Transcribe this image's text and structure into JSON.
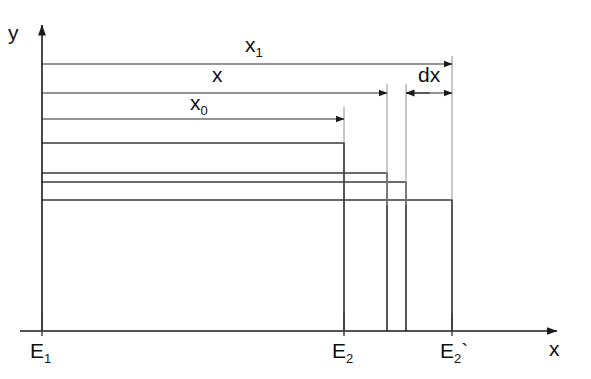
{
  "figure": {
    "background_color": "#ffffff",
    "line_color": "#1a1a1a",
    "rect_color": "#3a3a3a",
    "extension_color": "#9a9a9a",
    "width": 591,
    "height": 379
  },
  "axes": {
    "x_label": "x",
    "y_label": "y",
    "origin_x": 42,
    "origin_y": 331,
    "x_axis_end": 557,
    "y_axis_top": 25
  },
  "axis_ticks": [
    {
      "name": "E1",
      "base": "E",
      "subscript": "1",
      "prime": "",
      "x": 42
    },
    {
      "name": "E2",
      "base": "E",
      "subscript": "2",
      "prime": "",
      "x": 344
    },
    {
      "name": "E2-prime",
      "base": "E",
      "subscript": "2",
      "prime": "`",
      "x": 452
    }
  ],
  "dimensions": [
    {
      "name": "x1",
      "base": "x",
      "subscript": "1",
      "label_x": 245,
      "label_y": 52,
      "y": 64,
      "from_x": 42,
      "to_x": 452,
      "arrow_start": false,
      "arrow_end": true
    },
    {
      "name": "x",
      "base": "x",
      "subscript": "",
      "label_x": 212,
      "label_y": 82,
      "y": 93,
      "from_x": 42,
      "to_x": 387,
      "arrow_start": false,
      "arrow_end": true
    },
    {
      "name": "x0",
      "base": "x",
      "subscript": "0",
      "label_x": 190,
      "label_y": 110,
      "y": 119,
      "from_x": 42,
      "to_x": 344,
      "arrow_start": false,
      "arrow_end": true
    },
    {
      "name": "dx",
      "base": "dx",
      "subscript": "",
      "label_x": 418,
      "label_y": 82,
      "y": 93,
      "from_x": 406,
      "to_x": 452,
      "arrow_start": false,
      "arrow_end": true
    }
  ],
  "extension_lines": [
    {
      "name": "ext-x0",
      "x": 344,
      "y_top": 107,
      "y_bottom": 143
    },
    {
      "name": "ext-x",
      "x": 387,
      "y_top": 84,
      "y_bottom": 205
    },
    {
      "name": "ext-dx-left",
      "x": 406,
      "y_top": 84,
      "y_bottom": 205
    },
    {
      "name": "ext-x1",
      "x": 452,
      "y_top": 56,
      "y_bottom": 200
    }
  ],
  "rectangles": [
    {
      "name": "rect-x0",
      "left": 42,
      "right": 344,
      "top": 143,
      "bottom": 331
    },
    {
      "name": "rect-x",
      "left": 42,
      "right": 387,
      "top": 173,
      "bottom": 331
    },
    {
      "name": "rect-dx",
      "left": 42,
      "right": 406,
      "top": 182,
      "bottom": 331
    },
    {
      "name": "rect-x1",
      "left": 42,
      "right": 452,
      "top": 200,
      "bottom": 331
    }
  ]
}
